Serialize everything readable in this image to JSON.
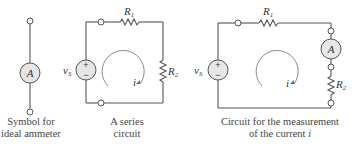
{
  "panels": [
    {
      "id": "ammeter-symbol",
      "meter_label": "A",
      "caption_line1": "Symbol for",
      "caption_line2": "ideal ammeter"
    },
    {
      "id": "series-circuit",
      "source_label": "v",
      "source_sub": "S",
      "r1_label": "R",
      "r1_sub": "1",
      "r2_label": "R",
      "r2_sub": "2",
      "current_label": "i",
      "plus": "+",
      "minus": "−",
      "caption_line1": "A series",
      "caption_line2": "circuit"
    },
    {
      "id": "measurement-circuit",
      "source_label": "v",
      "source_sub": "S",
      "r1_label": "R",
      "r1_sub": "1",
      "r2_label": "R",
      "r2_sub": "2",
      "meter_label": "A",
      "current_label": "i",
      "plus": "+",
      "minus": "−",
      "caption_line1": "Circuit for the measurement",
      "caption_line2_prefix": "of the current ",
      "caption_line2_var": "i"
    }
  ]
}
